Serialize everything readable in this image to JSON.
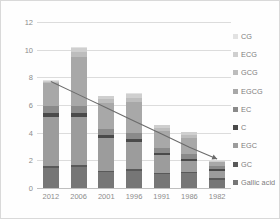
{
  "chart_data": {
    "type": "bar",
    "stacked": true,
    "title": "",
    "xlabel": "",
    "ylabel": "",
    "ylim": [
      0,
      12
    ],
    "yticks": [
      0,
      2,
      4,
      6,
      8,
      10,
      12
    ],
    "grid": true,
    "legend_position": "right",
    "categories": [
      "2012",
      "2006",
      "2001",
      "1996",
      "1991",
      "1986",
      "1982"
    ],
    "series": [
      {
        "name": "Gallic acid",
        "color": "#767676",
        "values": [
          1.45,
          1.55,
          1.15,
          1.22,
          1.0,
          1.05,
          0.6
        ]
      },
      {
        "name": "GC",
        "color": "#595959",
        "values": [
          0.15,
          0.12,
          0.1,
          0.12,
          0.08,
          0.08,
          0.1
        ]
      },
      {
        "name": "EGC",
        "color": "#9c9c9c",
        "values": [
          3.5,
          3.5,
          2.35,
          2.0,
          1.3,
          0.85,
          0.55
        ]
      },
      {
        "name": "C",
        "color": "#4a4a4a",
        "values": [
          0.35,
          0.28,
          0.22,
          0.22,
          0.18,
          0.15,
          0.12
        ]
      },
      {
        "name": "EC",
        "color": "#8a8a8a",
        "values": [
          0.5,
          0.5,
          0.45,
          0.42,
          0.35,
          0.3,
          0.2
        ]
      },
      {
        "name": "EGCG",
        "color": "#a8a8a8",
        "values": [
          1.65,
          3.55,
          1.9,
          2.25,
          1.22,
          1.2,
          0.28
        ]
      },
      {
        "name": "GCG",
        "color": "#bdbdbd",
        "values": [
          0.1,
          0.35,
          0.25,
          0.3,
          0.18,
          0.22,
          0.05
        ]
      },
      {
        "name": "ECG",
        "color": "#cfcfcf",
        "values": [
          0.05,
          0.3,
          0.2,
          0.28,
          0.22,
          0.18,
          0.03
        ]
      },
      {
        "name": "CG",
        "color": "#e2e2e2",
        "values": [
          0.03,
          0.05,
          0.03,
          0.04,
          0.02,
          0.02,
          0.02
        ]
      }
    ],
    "totals": [
      7.78,
      10.2,
      6.65,
      6.85,
      4.55,
      4.05,
      1.95
    ],
    "trend_line": {
      "name": "trend",
      "color": "#6b6b6b",
      "values": [
        7.7,
        6.75,
        5.8,
        4.85,
        3.9,
        2.95,
        2.1
      ]
    }
  },
  "legend": {
    "items": [
      {
        "label": "CG",
        "color": "#e2e2e2"
      },
      {
        "label": "ECG",
        "color": "#cfcfcf"
      },
      {
        "label": "GCG",
        "color": "#bdbdbd"
      },
      {
        "label": "EGCG",
        "color": "#a8a8a8"
      },
      {
        "label": "EC",
        "color": "#8a8a8a"
      },
      {
        "label": "C",
        "color": "#4a4a4a"
      },
      {
        "label": "EGC",
        "color": "#9c9c9c"
      },
      {
        "label": "GC",
        "color": "#595959"
      },
      {
        "label": "Gallic acid",
        "color": "#767676"
      }
    ]
  },
  "axis": {
    "y_labels": [
      "12",
      "10",
      "8",
      "6",
      "4",
      "2",
      "0"
    ],
    "x_labels": [
      "2012",
      "2006",
      "2001",
      "1996",
      "1991",
      "1986",
      "1982"
    ]
  },
  "colors": {
    "grid": "#dcdcdc",
    "axis_text": "#8c8c8c",
    "border": "#d9d9d9",
    "background": "#fefefe"
  }
}
